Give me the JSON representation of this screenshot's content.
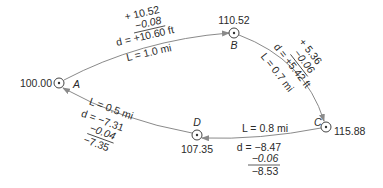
{
  "nodes": {
    "A": {
      "label": "A",
      "elevation": "100.00"
    },
    "B": {
      "label": "B",
      "elevation": "110.52"
    },
    "C": {
      "label": "C",
      "elevation": "115.88"
    },
    "D": {
      "label": "D",
      "elevation": "107.35"
    }
  },
  "edges": {
    "AB": {
      "rise": "+ 10.52",
      "correction": "−0.08",
      "d": "d = +10.60 ft",
      "L": "L = 1.0 mi"
    },
    "BC": {
      "rise": "+ 5.36",
      "correction": "−0.06",
      "d": "d = +5.42 ft",
      "L": "L = 0.7 mi"
    },
    "CD": {
      "L": "L = 0.8 mi",
      "d": "d = −8.47",
      "correction": "−0.06",
      "result": "−8.53"
    },
    "DA": {
      "L": "L = 0.5 mi",
      "d": "d = −7.31",
      "correction": "−0.04",
      "result": "−7.35"
    }
  },
  "colors": {
    "line": "#8a8a8a",
    "text": "#2a2a2a"
  }
}
